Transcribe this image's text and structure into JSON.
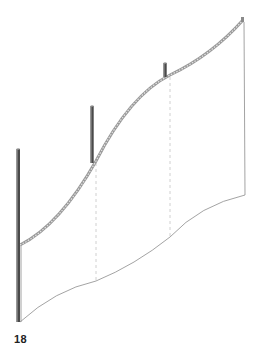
{
  "figure": {
    "label": "18",
    "colors": {
      "mast": "#4a4a4a",
      "mast_highlight": "#8a8a8a",
      "cable": "#9a9a9a",
      "cable_core": "#d8d8d8",
      "membrane_edge": "#8c8c8c",
      "dashed_guides": "#c4c4c4"
    },
    "masts": [
      {
        "name": "mast-1",
        "x": 18,
        "top": 149,
        "bottom": 322
      },
      {
        "name": "mast-2",
        "x": 92,
        "top": 106,
        "bottom": 161
      },
      {
        "name": "mast-3",
        "x": 165,
        "top": 63,
        "bottom": 75
      }
    ]
  }
}
